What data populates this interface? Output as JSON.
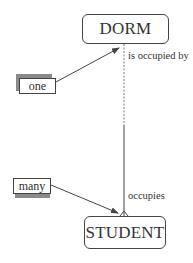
{
  "diagram": {
    "type": "entity-relationship",
    "entities": [
      {
        "id": "dorm",
        "label": "DORM"
      },
      {
        "id": "student",
        "label": "STUDENT"
      }
    ],
    "relationship": {
      "from": "DORM",
      "to": "STUDENT",
      "upper_label": "is occupied by",
      "lower_label": "occupies",
      "upper_cardinality": "one",
      "lower_cardinality": "many",
      "notation": "crow's foot at STUDENT end"
    },
    "annotations": [
      {
        "id": "one",
        "label": "one",
        "points_to": "DORM end of relationship"
      },
      {
        "id": "many",
        "label": "many",
        "points_to": "STUDENT end of relationship"
      }
    ]
  },
  "colors": {
    "line": "#444444",
    "shadow": "#8a8a8a",
    "background": "#ffffff"
  }
}
